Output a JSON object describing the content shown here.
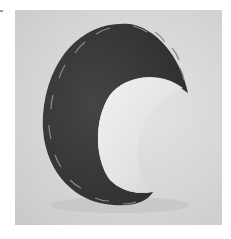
{
  "image": {
    "subject": "crescent moon shaped sculpture",
    "description": "Dark crescent-shaped object with stitched edges and a pale concave inner surface, photographed against a light grey backdrop",
    "colors": {
      "background": "#ffffff",
      "backdrop": "#d6d6d6",
      "crescent_body": "#3a3a3a",
      "crescent_inner": "#ececec",
      "stitching": "#8a8a8a"
    }
  }
}
